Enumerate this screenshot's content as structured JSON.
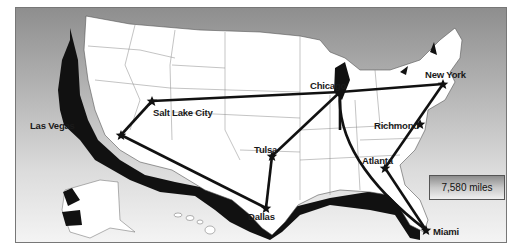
{
  "map": {
    "title": "US route map",
    "colors": {
      "background_top": "#8e8e8e",
      "background_bottom": "#f4f4f4",
      "land": "#ffffff",
      "shadow": "#111111",
      "route": "#111111"
    },
    "cities": [
      {
        "name": "Salt Lake City",
        "x": 152,
        "y": 101
      },
      {
        "name": "Las Vegas",
        "x": 121,
        "y": 135
      },
      {
        "name": "Chicago",
        "x": 340,
        "y": 92
      },
      {
        "name": "New York",
        "x": 443,
        "y": 84
      },
      {
        "name": "Richmond",
        "x": 420,
        "y": 124
      },
      {
        "name": "Atlanta",
        "x": 385,
        "y": 168
      },
      {
        "name": "Tulsa",
        "x": 272,
        "y": 156
      },
      {
        "name": "Dallas",
        "x": 266,
        "y": 208
      },
      {
        "name": "Miami",
        "x": 426,
        "y": 230
      }
    ],
    "routes": [
      [
        "Las Vegas",
        "Salt Lake City"
      ],
      [
        "Salt Lake City",
        "Chicago"
      ],
      [
        "Chicago",
        "New York"
      ],
      [
        "New York",
        "Atlanta"
      ],
      [
        "Atlanta",
        "Miami"
      ],
      [
        "Miami",
        "Chicago"
      ],
      [
        "Chicago",
        "Tulsa"
      ],
      [
        "Tulsa",
        "Dallas"
      ],
      [
        "Dallas",
        "Las Vegas"
      ]
    ],
    "total_distance": "7,580 miles"
  }
}
